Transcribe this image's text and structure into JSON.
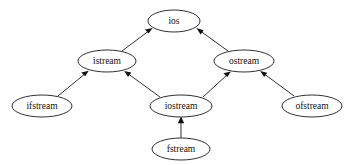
{
  "diagram": {
    "background_color": "#ffffff",
    "node_fill": "#ffffff",
    "node_stroke": "#1a1a1a",
    "edge_color": "#1a1a1a",
    "text_color": "#111111",
    "nodes": [
      {
        "id": "ios",
        "label": "ios",
        "cx": 174,
        "cy": 21,
        "rx": 26,
        "ry": 11
      },
      {
        "id": "istream",
        "label": "istream",
        "cx": 107,
        "cy": 61,
        "rx": 29,
        "ry": 11
      },
      {
        "id": "ostream",
        "label": "ostream",
        "cx": 244,
        "cy": 61,
        "rx": 30,
        "ry": 11
      },
      {
        "id": "ifstream",
        "label": "ifstream",
        "cx": 42,
        "cy": 106,
        "rx": 30,
        "ry": 11
      },
      {
        "id": "iostream",
        "label": "iostream",
        "cx": 181,
        "cy": 106,
        "rx": 31,
        "ry": 11
      },
      {
        "id": "ofstream",
        "label": "ofstream",
        "cx": 312,
        "cy": 106,
        "rx": 30,
        "ry": 11
      },
      {
        "id": "fstream",
        "label": "fstream",
        "cx": 181,
        "cy": 149,
        "rx": 29,
        "ry": 11
      }
    ],
    "edges": [
      {
        "from": "istream",
        "to": "ios",
        "relation": "inherits"
      },
      {
        "from": "ostream",
        "to": "ios",
        "relation": "inherits"
      },
      {
        "from": "ifstream",
        "to": "istream",
        "relation": "inherits"
      },
      {
        "from": "iostream",
        "to": "istream",
        "relation": "inherits"
      },
      {
        "from": "iostream",
        "to": "ostream",
        "relation": "inherits"
      },
      {
        "from": "ofstream",
        "to": "ostream",
        "relation": "inherits"
      },
      {
        "from": "fstream",
        "to": "iostream",
        "relation": "inherits"
      }
    ]
  }
}
